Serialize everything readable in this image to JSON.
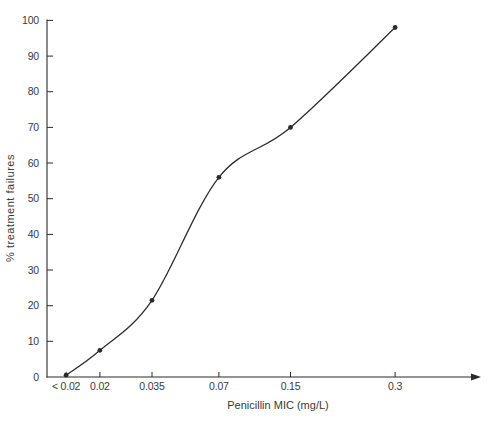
{
  "figure": {
    "background": "#ffffff",
    "ink_color": "#2b2b2b",
    "text_color": "#3a3a3a"
  },
  "chart_data": {
    "type": "line",
    "title": "",
    "xlabel": "Penicillin MIC (mg/L)",
    "ylabel": "% treatment failures",
    "categories": [
      "< 0.02",
      "0.02",
      "0.035",
      "0.07",
      "0.15",
      "0.3"
    ],
    "values": [
      0.5,
      7.5,
      21.5,
      56,
      70,
      98
    ],
    "ylim": [
      0,
      100
    ],
    "y_tick_step": 10,
    "y_tick_labels": [
      "0",
      "10",
      "20",
      "30",
      "40",
      "50",
      "60",
      "70",
      "80",
      "90",
      "100"
    ],
    "x_tick_fractions": [
      0.044,
      0.122,
      0.242,
      0.396,
      0.561,
      0.802
    ],
    "x_axis_arrow": true,
    "grid": false,
    "legend": "none",
    "marker": "filled-circle",
    "marker_radius_px": 2.4,
    "line_color": "#2b2b2b"
  }
}
